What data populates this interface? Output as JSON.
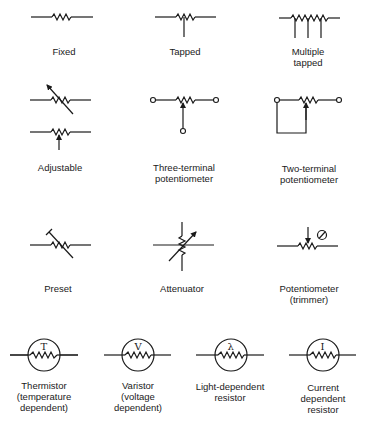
{
  "symbols": [
    {
      "id": "fixed",
      "lines": [
        "Fixed"
      ]
    },
    {
      "id": "tapped",
      "lines": [
        "Tapped"
      ]
    },
    {
      "id": "multiple-tapped",
      "lines": [
        "Multiple",
        "tapped"
      ]
    },
    {
      "id": "adjustable",
      "lines": [
        "Adjustable"
      ]
    },
    {
      "id": "three-terminal-potentiometer",
      "lines": [
        "Three-terminal",
        "potentiometer"
      ]
    },
    {
      "id": "two-terminal-potentiometer",
      "lines": [
        "Two-terminal",
        "potentiometer"
      ]
    },
    {
      "id": "preset",
      "lines": [
        "Preset"
      ]
    },
    {
      "id": "attenuator",
      "lines": [
        "Attenuator"
      ]
    },
    {
      "id": "potentiometer-trimmer",
      "lines": [
        "Potentiometer",
        "(trimmer)"
      ]
    },
    {
      "id": "thermistor",
      "lines": [
        "Thermistor",
        "(temperature",
        "dependent)"
      ],
      "glyph": "T"
    },
    {
      "id": "varistor",
      "lines": [
        "Varistor",
        "(voltage",
        "dependent)"
      ],
      "glyph": "V"
    },
    {
      "id": "light-dependent-resistor",
      "lines": [
        "Light-dependent",
        "resistor"
      ],
      "glyph": "λ"
    },
    {
      "id": "current-dependent-resistor",
      "lines": [
        "Current",
        "dependent",
        "resistor"
      ],
      "glyph": "I"
    }
  ],
  "colors": {
    "ink": "#1a1a1a",
    "background": "#ffffff"
  }
}
